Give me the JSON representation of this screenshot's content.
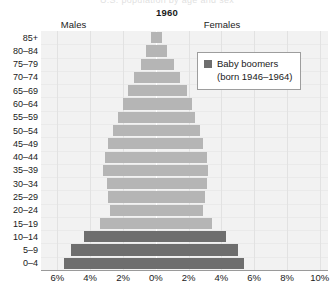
{
  "header": {
    "clipped_top_text": "U.S. population by age and sex",
    "title": "1960",
    "males_label": "Males",
    "females_label": "Females"
  },
  "legend": {
    "swatch_color": "#6e6e6e",
    "label": "Baby boomers",
    "sublabel": "(born 1946–1964)"
  },
  "colors": {
    "bar_general": "#b5b5b5",
    "bar_boomer": "#6e6e6e",
    "plot_background": "#f2f2f2",
    "gridline": "#e2e2e2",
    "axis": "#9a9a9a"
  },
  "chart_data": {
    "type": "bar",
    "subtype": "population-pyramid",
    "title": "1960",
    "xlabel": "",
    "ylabel": "",
    "grid": true,
    "legend_position": "top-right",
    "axis_min_percent": -7.0,
    "axis_max_percent": 10.5,
    "xtick_values": [
      -6,
      -4,
      -2,
      0,
      2,
      4,
      6,
      8,
      10
    ],
    "xtick_labels": [
      "6%",
      "4%",
      "2%",
      "0%",
      "2%",
      "4%",
      "6%",
      "8%",
      "10%"
    ],
    "categories": [
      "85+",
      "80–84",
      "75–79",
      "70–74",
      "65–69",
      "60–64",
      "55–59",
      "50–54",
      "45–49",
      "40–44",
      "35–39",
      "30–34",
      "25–29",
      "20–24",
      "15–19",
      "10–14",
      "5–9",
      "0–4"
    ],
    "series": [
      {
        "name": "Males",
        "direction": "left",
        "values": [
          0.3,
          0.6,
          0.9,
          1.3,
          1.7,
          2.0,
          2.3,
          2.6,
          2.9,
          3.1,
          3.2,
          3.0,
          2.9,
          2.8,
          3.4,
          4.4,
          5.2,
          5.6
        ]
      },
      {
        "name": "Females",
        "direction": "right",
        "values": [
          0.4,
          0.7,
          1.1,
          1.5,
          1.9,
          2.2,
          2.4,
          2.7,
          2.9,
          3.1,
          3.2,
          3.1,
          3.0,
          2.9,
          3.4,
          4.3,
          5.0,
          5.4
        ]
      }
    ],
    "boomer_categories": [
      "0–4",
      "5–9",
      "10–14"
    ]
  }
}
